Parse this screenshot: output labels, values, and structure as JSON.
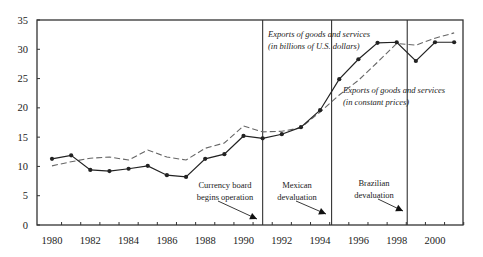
{
  "chart_data": {
    "type": "line",
    "title": "",
    "xlabel": "",
    "ylabel": "",
    "xlim": [
      1979.6,
      2001.5
    ],
    "ylim": [
      0,
      35
    ],
    "grid": false,
    "x": [
      1980,
      1981,
      1982,
      1983,
      1984,
      1985,
      1986,
      1987,
      1988,
      1989,
      1990,
      1991,
      1992,
      1993,
      1994,
      1995,
      1996,
      1997,
      1998,
      1999,
      2000,
      2001
    ],
    "series": [
      {
        "name": "Exports of goods and services (in billions of U.S. dollars)",
        "style": "solid-with-markers",
        "color": "#222222",
        "values": [
          11.3,
          11.9,
          9.4,
          9.2,
          9.6,
          10.1,
          8.5,
          8.2,
          11.3,
          12.1,
          15.2,
          14.8,
          15.5,
          16.7,
          19.6,
          24.9,
          28.3,
          31.1,
          31.2,
          28.0,
          31.2,
          31.2
        ]
      },
      {
        "name": "Exports of goods and services (in constant prices)",
        "style": "dashed",
        "color": "#666666",
        "values": [
          10.1,
          10.8,
          11.4,
          11.6,
          11.1,
          12.8,
          11.6,
          11.1,
          13.1,
          14.0,
          16.9,
          15.9,
          16.0,
          16.6,
          19.3,
          22.2,
          24.7,
          27.8,
          31.0,
          30.7,
          31.9,
          32.8
        ]
      }
    ],
    "x_ticks": [
      "1980",
      "1982",
      "1984",
      "1986",
      "1988",
      "1990",
      "1992",
      "1994",
      "1996",
      "1998",
      "2000"
    ],
    "y_ticks": [
      "0",
      "5",
      "10",
      "15",
      "20",
      "25",
      "30",
      "35"
    ],
    "vertical_lines": [
      1991.0,
      1994.6,
      1998.55
    ],
    "annotations": [
      {
        "lines": [
          "Currency board",
          "begins operation"
        ],
        "arrow_to_x": 1991.0
      },
      {
        "lines": [
          "Mexican",
          "devaluation"
        ],
        "arrow_to_x": 1994.6
      },
      {
        "lines": [
          "Brazilian",
          "devaluation"
        ],
        "arrow_to_x": 1998.55
      }
    ],
    "series_labels": [
      {
        "lines": [
          "Exports of goods and services",
          "(in billions of U.S. dollars)"
        ]
      },
      {
        "lines": [
          "Exports of goods and services",
          "(in constant prices)"
        ]
      }
    ],
    "legend": "inline labels"
  }
}
